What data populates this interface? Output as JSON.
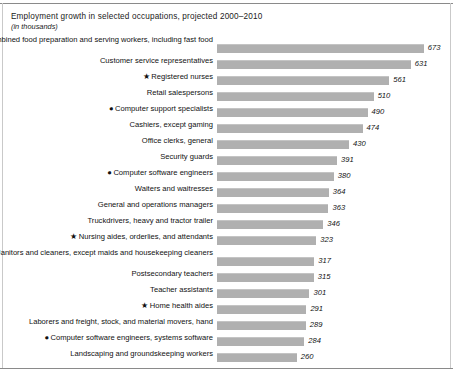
{
  "chart": {
    "title": "Employment growth in selected occupations, projected 2000–2010",
    "subtitle": "(in thousands)"
  },
  "markers": {
    "star": "★",
    "dot": "●",
    "none": ""
  },
  "chart_data": {
    "type": "bar",
    "orientation": "horizontal",
    "title": "Employment growth in selected occupations, projected 2000–2010",
    "subtitle": "(in thousands)",
    "xlabel": "",
    "ylabel": "",
    "units": "thousands",
    "xlim": [
      0,
      700
    ],
    "grid": false,
    "legend": "none",
    "bar_color": "#b0b0b0",
    "categories": [
      "Combined food preparation and serving workers, including fast food",
      "Customer service representatives",
      "Registered nurses",
      "Retail salespersons",
      "Computer support specialists",
      "Cashiers, except gaming",
      "Office clerks, general",
      "Security guards",
      "Computer software engineers",
      "Waiters and waitresses",
      "General and operations managers",
      "Truckdrivers, heavy and tractor trailer",
      "Nursing aides, orderlies, and attendants",
      "Janitors and cleaners, except maids and housekeeping cleaners",
      "Postsecondary teachers",
      "Teacher assistants",
      "Home health aides",
      "Laborers and freight, stock, and material movers, hand",
      "Computer software engineers, systems software",
      "Landscaping and groundskeeping workers"
    ],
    "values": [
      673,
      631,
      561,
      510,
      490,
      474,
      430,
      391,
      380,
      364,
      363,
      346,
      323,
      317,
      315,
      301,
      291,
      289,
      284,
      260
    ],
    "markers": [
      "none",
      "none",
      "star",
      "none",
      "dot",
      "none",
      "none",
      "none",
      "dot",
      "none",
      "none",
      "none",
      "star",
      "none",
      "none",
      "none",
      "star",
      "none",
      "dot",
      "none"
    ]
  },
  "rows": [
    {
      "label": "Combined food preparation and serving workers, including fast food",
      "value": 673,
      "value_text": "673",
      "marker": "",
      "twoline": true
    },
    {
      "label": "Customer service representatives",
      "value": 631,
      "value_text": "631",
      "marker": "",
      "twoline": false
    },
    {
      "label": "Registered nurses",
      "value": 561,
      "value_text": "561",
      "marker": "★",
      "twoline": false
    },
    {
      "label": "Retail salespersons",
      "value": 510,
      "value_text": "510",
      "marker": "",
      "twoline": false
    },
    {
      "label": "Computer support specialists",
      "value": 490,
      "value_text": "490",
      "marker": "●",
      "twoline": false
    },
    {
      "label": "Cashiers, except gaming",
      "value": 474,
      "value_text": "474",
      "marker": "",
      "twoline": false
    },
    {
      "label": "Office clerks, general",
      "value": 430,
      "value_text": "430",
      "marker": "",
      "twoline": false
    },
    {
      "label": "Security guards",
      "value": 391,
      "value_text": "391",
      "marker": "",
      "twoline": false
    },
    {
      "label": "Computer software engineers",
      "value": 380,
      "value_text": "380",
      "marker": "●",
      "twoline": false
    },
    {
      "label": "Waiters and waitresses",
      "value": 364,
      "value_text": "364",
      "marker": "",
      "twoline": false
    },
    {
      "label": "General and operations managers",
      "value": 363,
      "value_text": "363",
      "marker": "",
      "twoline": false
    },
    {
      "label": "Truckdrivers, heavy and tractor trailer",
      "value": 346,
      "value_text": "346",
      "marker": "",
      "twoline": false
    },
    {
      "label": "Nursing aides, orderlies, and attendants",
      "value": 323,
      "value_text": "323",
      "marker": "★",
      "twoline": false
    },
    {
      "label": "Janitors and cleaners, except maids and housekeeping cleaners",
      "value": 317,
      "value_text": "317",
      "marker": "",
      "twoline": true
    },
    {
      "label": "Postsecondary teachers",
      "value": 315,
      "value_text": "315",
      "marker": "",
      "twoline": false
    },
    {
      "label": "Teacher assistants",
      "value": 301,
      "value_text": "301",
      "marker": "",
      "twoline": false
    },
    {
      "label": "Home health aides",
      "value": 291,
      "value_text": "291",
      "marker": "★",
      "twoline": false
    },
    {
      "label": "Laborers and freight, stock, and material movers, hand",
      "value": 289,
      "value_text": "289",
      "marker": "",
      "twoline": false
    },
    {
      "label": "Computer software engineers, systems software",
      "value": 284,
      "value_text": "284",
      "marker": "●",
      "twoline": false
    },
    {
      "label": "Landscaping and groundskeeping workers",
      "value": 260,
      "value_text": "260",
      "marker": "",
      "twoline": false
    }
  ]
}
